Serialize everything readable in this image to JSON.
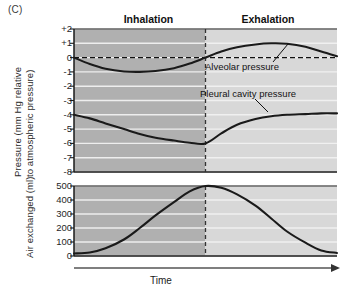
{
  "figure": {
    "panel_label": "(C)",
    "phases": {
      "inhalation": "Inhalation",
      "exhalation": "Exhalation"
    },
    "x_axis_label": "Time"
  },
  "pressure_chart": {
    "y_axis_title_line1": "Pressure (mm Hg relative",
    "y_axis_title_line2": "to atmospheric pressure)",
    "ticks": [
      "+2",
      "+1",
      "0",
      "-1",
      "-2",
      "-3",
      "-4",
      "-5",
      "-6",
      "-7",
      "-8"
    ],
    "series_labels": {
      "alveolar": "Alveolar pressure",
      "pleural": "Pleural cavity pressure"
    }
  },
  "volume_chart": {
    "y_axis_title": "Air exchanged (ml)",
    "ticks": [
      "500",
      "400",
      "300",
      "200",
      "100",
      "0"
    ]
  },
  "colors": {
    "inhalation_band": "#b0b0b0",
    "exhalation_band": "#d8d8d8",
    "gridline": "#f2f2f2",
    "curve": "#1a1a1a",
    "axis": "#1a1a1a",
    "divider": "#333333"
  },
  "chart_data": [
    {
      "type": "line",
      "title": "Pressure (mm Hg relative to atmospheric pressure)",
      "xlabel": "Time",
      "ylabel": "Pressure (mm Hg relative to atmospheric pressure)",
      "ylim": [
        -8,
        2
      ],
      "xlim": [
        0,
        100
      ],
      "grid": true,
      "legend": "inline-annotations",
      "yticks": [
        2,
        1,
        0,
        -1,
        -2,
        -3,
        -4,
        -5,
        -6,
        -7,
        -8
      ],
      "ytick_labels": [
        "+2",
        "+1",
        "0",
        "-1",
        "-2",
        "-3",
        "-4",
        "-5",
        "-6",
        "-7",
        "-8"
      ],
      "phase_divider_x": 50,
      "reference_line_y": 0,
      "series": [
        {
          "name": "Alveolar pressure",
          "x": [
            0,
            6,
            12,
            19,
            25,
            31,
            38,
            44,
            50,
            56,
            62,
            69,
            75,
            81,
            88,
            94,
            100
          ],
          "values": [
            0.0,
            -0.45,
            -0.78,
            -0.97,
            -1.0,
            -0.94,
            -0.74,
            -0.42,
            0.0,
            0.42,
            0.72,
            0.92,
            1.0,
            0.97,
            0.76,
            0.42,
            0.1
          ]
        },
        {
          "name": "Pleural cavity pressure",
          "x": [
            0,
            6,
            12,
            19,
            25,
            31,
            38,
            44,
            50,
            56,
            62,
            69,
            75,
            81,
            88,
            94,
            100
          ],
          "values": [
            -4.0,
            -4.25,
            -4.6,
            -5.0,
            -5.35,
            -5.6,
            -5.8,
            -5.95,
            -6.0,
            -5.3,
            -4.7,
            -4.3,
            -4.1,
            -4.0,
            -3.95,
            -3.9,
            -3.9
          ]
        }
      ]
    },
    {
      "type": "line",
      "title": "Air exchanged (ml)",
      "xlabel": "Time",
      "ylabel": "Air exchanged (ml)",
      "ylim": [
        0,
        500
      ],
      "xlim": [
        0,
        100
      ],
      "grid": true,
      "yticks": [
        500,
        400,
        300,
        200,
        100,
        0
      ],
      "ytick_labels": [
        "500",
        "400",
        "300",
        "200",
        "100",
        "0"
      ],
      "phase_divider_x": 50,
      "series": [
        {
          "name": "Air exchanged",
          "x": [
            0,
            6,
            12,
            19,
            25,
            31,
            38,
            44,
            50,
            56,
            62,
            69,
            75,
            81,
            88,
            94,
            100
          ],
          "values": [
            18,
            25,
            55,
            118,
            200,
            290,
            385,
            462,
            500,
            487,
            440,
            360,
            268,
            175,
            95,
            40,
            22
          ]
        }
      ]
    }
  ]
}
